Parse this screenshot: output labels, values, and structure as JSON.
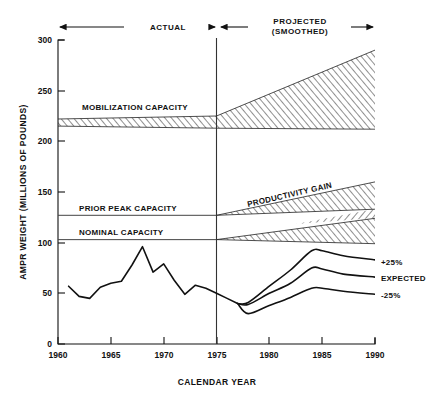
{
  "chart_data": {
    "type": "line",
    "title": "",
    "xlabel": "CALENDAR YEAR",
    "ylabel": "AMPR WEIGHT (MILLIONS OF POUNDS)",
    "xlim": [
      1960,
      1990
    ],
    "ylim": [
      0,
      300
    ],
    "xticks": [
      1960,
      1965,
      1970,
      1975,
      1980,
      1985,
      1990
    ],
    "yticks": [
      0,
      50,
      100,
      150,
      200,
      250,
      300
    ],
    "grid": false,
    "legend": "inline-right",
    "period_divider_year": 1975,
    "annotations": {
      "actual_label": "ACTUAL",
      "projected_label_line1": "PROJECTED",
      "projected_label_line2": "(SMOOTHED)",
      "mobilization_label": "MOBILIZATION CAPACITY",
      "prior_peak_label": "PRIOR PEAK CAPACITY",
      "nominal_label": "NOMINAL CAPACITY",
      "productivity_label": "PRODUCTIVITY GAIN"
    },
    "reference_lines": [
      {
        "name": "PRIOR PEAK CAPACITY",
        "value": 127,
        "x_from": 1960,
        "x_to": 1975
      },
      {
        "name": "NOMINAL CAPACITY",
        "value": 103,
        "x_from": 1960,
        "x_to": 1975
      }
    ],
    "bands": [
      {
        "name": "MOBILIZATION CAPACITY",
        "hatch": "diagonal",
        "x": [
          1960,
          1975,
          1990
        ],
        "upper": [
          222,
          225,
          290
        ],
        "lower": [
          215,
          213,
          212
        ]
      },
      {
        "name": "PRODUCTIVITY GAIN UPPER",
        "hatch": "diagonal",
        "x": [
          1975,
          1990
        ],
        "upper": [
          127,
          160
        ],
        "lower": [
          127,
          133
        ]
      },
      {
        "name": "PRODUCTIVITY GAIN LOWER",
        "hatch": "diagonal",
        "x": [
          1975,
          1990
        ],
        "upper": [
          103,
          124
        ],
        "lower": [
          103,
          99
        ]
      }
    ],
    "series": [
      {
        "name": "ACTUAL",
        "label": "",
        "x": [
          1961,
          1962,
          1963,
          1964,
          1965,
          1966,
          1967,
          1968,
          1969,
          1970,
          1971,
          1972,
          1973,
          1974,
          1975,
          1976,
          1977
        ],
        "values": [
          57,
          47,
          45,
          56,
          60,
          62,
          78,
          96,
          71,
          79,
          63,
          49,
          58,
          55,
          50,
          45,
          40
        ]
      },
      {
        "name": "PLUS_25",
        "label": "+25%",
        "x": [
          1977,
          1978,
          1980,
          1982,
          1984,
          1985,
          1987,
          1990
        ],
        "values": [
          40,
          41,
          57,
          73,
          92,
          92,
          87,
          83
        ]
      },
      {
        "name": "EXPECTED",
        "label": "EXPECTED",
        "x": [
          1977,
          1978,
          1980,
          1982,
          1984,
          1985,
          1987,
          1990
        ],
        "values": [
          40,
          39,
          50,
          60,
          75,
          74,
          69,
          66
        ]
      },
      {
        "name": "MINUS_25",
        "label": "-25%",
        "x": [
          1977,
          1978,
          1980,
          1982,
          1984,
          1985,
          1987,
          1990
        ],
        "values": [
          40,
          30,
          38,
          46,
          55,
          55,
          52,
          49
        ]
      }
    ]
  },
  "axis": {
    "y_title": "AMPR WEIGHT (MILLIONS OF POUNDS)",
    "x_title": "CALENDAR YEAR",
    "y_tick_0": "0",
    "y_tick_50": "50",
    "y_tick_100": "100",
    "y_tick_150": "150",
    "y_tick_200": "200",
    "y_tick_250": "250",
    "y_tick_300": "300",
    "x_tick_1960": "1960",
    "x_tick_1965": "1965",
    "x_tick_1970": "1970",
    "x_tick_1975": "1975",
    "x_tick_1980": "1980",
    "x_tick_1985": "1985",
    "x_tick_1990": "1990"
  },
  "headers": {
    "actual": "ACTUAL",
    "projected_line1": "PROJECTED",
    "projected_line2": "(SMOOTHED)"
  },
  "labels": {
    "mobilization_capacity": "MOBILIZATION CAPACITY",
    "prior_peak_capacity": "PRIOR PEAK CAPACITY",
    "nominal_capacity": "NOMINAL CAPACITY",
    "productivity_gain": "PRODUCTIVITY GAIN",
    "plus_25": "+25%",
    "expected": "EXPECTED",
    "minus_25": "-25%"
  }
}
